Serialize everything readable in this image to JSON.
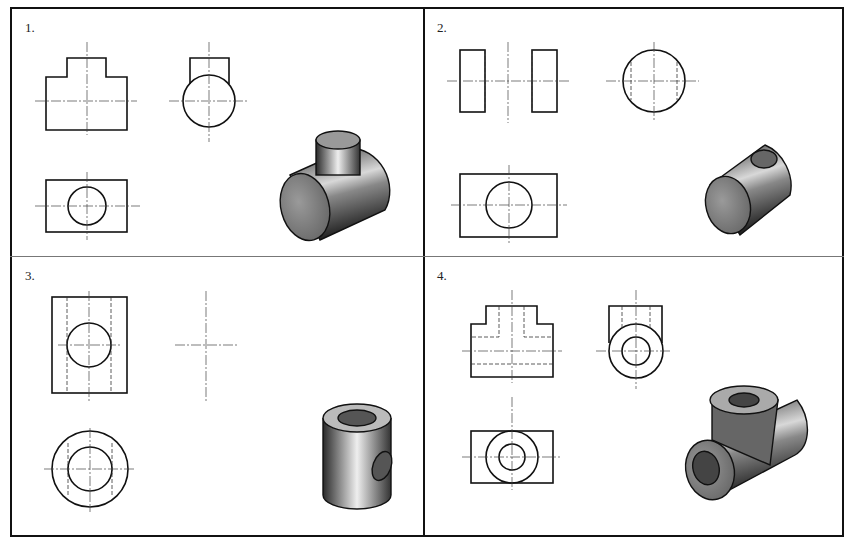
{
  "figure": {
    "panels": [
      {
        "number": "1.",
        "description": "T-shaped solid: horizontal cylinder with vertical solid cylinder boss; front, side, top orthographic views plus shaded isometric"
      },
      {
        "number": "2.",
        "description": "Horizontal cylinder with vertical through-hole; front view with hidden lines, side view circle, top view, shaded isometric"
      },
      {
        "number": "3.",
        "description": "Vertical hollow cylinder with horizontal cross hole; front view, incomplete side view (centerlines only), top view concentric circles, shaded isometric"
      },
      {
        "number": "4.",
        "description": "Hollow pipe tee; front view with hidden lines, side view concentric circles, top view concentric circles, shaded isometric"
      }
    ]
  }
}
